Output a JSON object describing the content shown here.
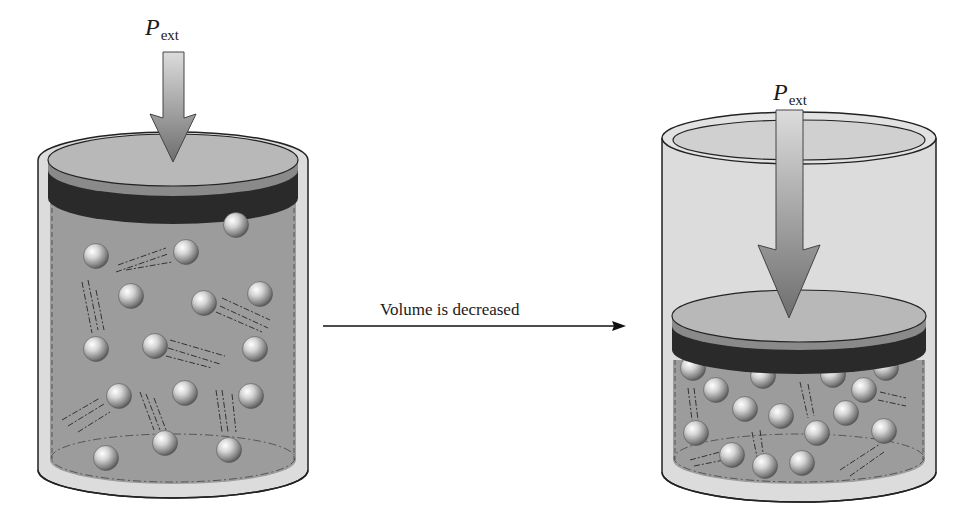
{
  "figure": {
    "left_container": {
      "label_symbol": "P",
      "label_subscript": "ext",
      "state": "larger volume",
      "particle_count": 16
    },
    "transition": {
      "caption": "Volume is decreased"
    },
    "right_container": {
      "label_symbol": "P",
      "label_subscript": "ext",
      "state": "smaller volume",
      "particle_count": 22
    },
    "colors": {
      "gas_fill": "#9a9a9a",
      "glass": "#d8d8d8",
      "piston_top": "#b4b4b4",
      "piston_band": "#2a2a2a",
      "arrow": "#8c8c8c",
      "outline": "#222222"
    }
  }
}
